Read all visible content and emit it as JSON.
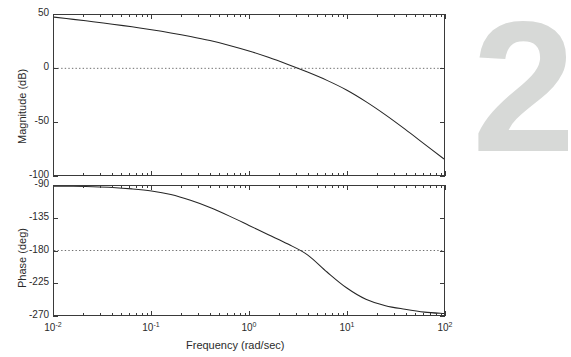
{
  "figure": {
    "watermark": "2",
    "background_color": "#ffffff",
    "curve_color": "#262626",
    "axis_color": "#3a3a3a",
    "refline_color": "#6d6d6d",
    "watermark_color": "#d7d9d7"
  },
  "xaxis": {
    "title": "Frequency  (rad/sec)",
    "scale": "log",
    "range": [
      0.01,
      100
    ],
    "tick_labels": [
      "10",
      "10",
      "10",
      "10",
      "10"
    ],
    "tick_exponents": [
      "-2",
      "-1",
      "0",
      "1",
      "2"
    ],
    "tick_values": [
      0.01,
      0.1,
      1,
      10,
      100
    ]
  },
  "magnitude_axis": {
    "title": "Magnitude (dB)",
    "range": [
      -100,
      50
    ],
    "tick_labels": [
      "50",
      "0",
      "-50",
      "-100"
    ],
    "tick_values": [
      50,
      0,
      -50,
      -100
    ],
    "reference_line": 0
  },
  "phase_axis": {
    "title": "Phase (deg)",
    "range": [
      -270,
      -90
    ],
    "tick_labels": [
      "-90",
      "-135",
      "-180",
      "-225",
      "-270"
    ],
    "tick_values": [
      -90,
      -135,
      -180,
      -225,
      -270
    ],
    "reference_line": -180
  },
  "chart_data": {
    "type": "line",
    "title": "",
    "xlabel": "Frequency  (rad/sec)",
    "subplots": [
      {
        "name": "magnitude",
        "ylabel": "Magnitude (dB)",
        "ylim": [
          -100,
          50
        ],
        "xlim": [
          0.01,
          100
        ],
        "grid": false,
        "reference_line": 0,
        "gain_crossover_rad_per_sec": 0.95,
        "x": [
          0.01,
          0.0158,
          0.0251,
          0.0398,
          0.0631,
          0.1,
          0.158,
          0.251,
          0.398,
          0.631,
          1.0,
          1.58,
          2.51,
          3.98,
          6.31,
          10.0,
          15.8,
          25.1,
          39.8,
          63.1,
          100.0
        ],
        "values": [
          48.0,
          45.9,
          43.7,
          41.4,
          38.9,
          36.2,
          33.2,
          29.8,
          26.0,
          21.5,
          16.3,
          10.3,
          3.6,
          -3.5,
          -11.3,
          -20.3,
          -31.2,
          -43.6,
          -57.0,
          -71.0,
          -85.0
        ]
      },
      {
        "name": "phase",
        "ylabel": "Phase (deg)",
        "ylim": [
          -270,
          -90
        ],
        "xlim": [
          0.01,
          100
        ],
        "grid": false,
        "reference_line": -180,
        "phase_crossover_rad_per_sec": 5.0,
        "x": [
          0.01,
          0.0158,
          0.0251,
          0.0398,
          0.0631,
          0.1,
          0.158,
          0.251,
          0.398,
          0.631,
          1.0,
          1.58,
          2.51,
          3.98,
          6.31,
          10.0,
          15.8,
          25.1,
          39.8,
          63.1,
          100.0
        ],
        "values": [
          -90.3,
          -90.5,
          -91.0,
          -92.0,
          -94.0,
          -97.0,
          -102.0,
          -110.0,
          -120.0,
          -132.0,
          -145.0,
          -158.0,
          -171.0,
          -186.0,
          -210.0,
          -232.0,
          -248.0,
          -257.0,
          -262.0,
          -266.0,
          -268.0
        ]
      }
    ]
  }
}
